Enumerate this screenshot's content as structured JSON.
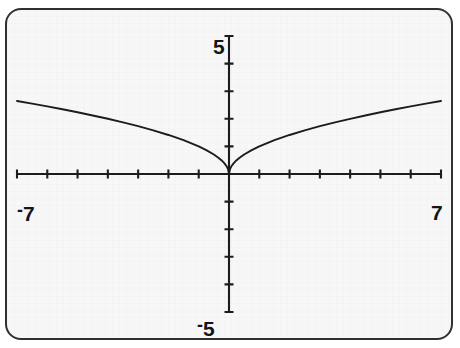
{
  "screen": {
    "device": "graphing-calculator-screen",
    "background_color": "#f7f7f7",
    "border_color": "#2f3033",
    "ink_color": "#1b1c1e"
  },
  "labels": {
    "y_max": "5",
    "y_min_negative_sign": "-",
    "y_min_magnitude": "5",
    "x_min_negative_sign": "-",
    "x_min_magnitude": "7",
    "x_max": "7"
  },
  "chart_data": {
    "type": "line",
    "title": "",
    "subtitle": "",
    "xlabel": "",
    "ylabel": "",
    "xlim": [
      -7,
      7
    ],
    "ylim": [
      -5,
      5
    ],
    "xticks": [
      -7,
      -6,
      -5,
      -4,
      -3,
      -2,
      -1,
      0,
      1,
      2,
      3,
      4,
      5,
      6,
      7
    ],
    "yticks": [
      -5,
      -4,
      -3,
      -2,
      -1,
      0,
      1,
      2,
      3,
      4,
      5
    ],
    "xtick_labels": [
      "-7",
      "",
      "",
      "",
      "",
      "",
      "",
      "",
      "",
      "",
      "",
      "",
      "",
      "",
      "7"
    ],
    "ytick_labels": [
      "-5",
      "",
      "",
      "",
      "",
      "",
      "",
      "",
      "",
      "",
      "5"
    ],
    "grid": false,
    "legend": false,
    "legend_position": "none",
    "axes_style": "centered-cross",
    "annotations": [],
    "series": [
      {
        "name": "y = sqrt(|x|)",
        "expression": "y = sqrt(abs(x))",
        "color": "#1b1c1e",
        "linewidth": 1.9,
        "x": [
          -7,
          -6.5,
          -6,
          -5.5,
          -5,
          -4.5,
          -4,
          -3.5,
          -3,
          -2.5,
          -2,
          -1.5,
          -1,
          -0.75,
          -0.5,
          -0.35,
          -0.25,
          -0.15,
          -0.08,
          -0.03,
          0,
          0.03,
          0.08,
          0.15,
          0.25,
          0.35,
          0.5,
          0.75,
          1,
          1.5,
          2,
          2.5,
          3,
          3.5,
          4,
          4.5,
          5,
          5.5,
          6,
          6.5,
          7
        ],
        "y": [
          2.646,
          2.55,
          2.449,
          2.345,
          2.236,
          2.121,
          2.0,
          1.871,
          1.732,
          1.581,
          1.414,
          1.225,
          1.0,
          0.866,
          0.707,
          0.592,
          0.5,
          0.387,
          0.283,
          0.173,
          0.0,
          0.173,
          0.283,
          0.387,
          0.5,
          0.592,
          0.707,
          0.866,
          1.0,
          1.225,
          1.414,
          1.581,
          1.732,
          1.871,
          2.0,
          2.121,
          2.236,
          2.345,
          2.449,
          2.55,
          2.646
        ]
      }
    ]
  }
}
